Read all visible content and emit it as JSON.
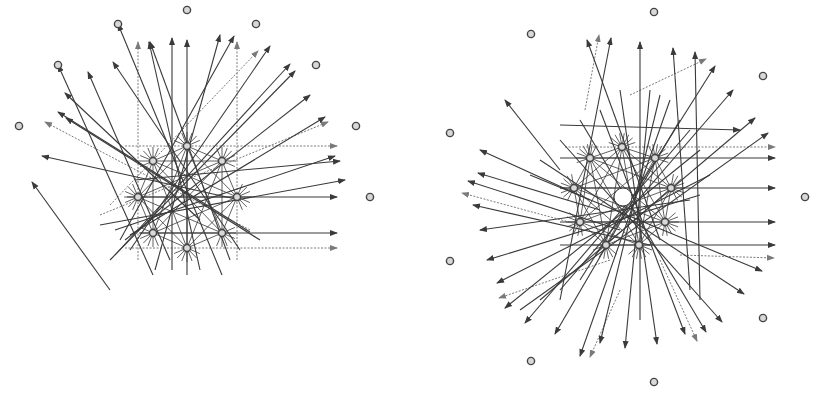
{
  "canvas": {
    "width": 816,
    "height": 395,
    "background": "#ffffff"
  },
  "colors": {
    "line": "#3a3a3a",
    "dashed_line": "#7a7a7a",
    "node_fill": "#d8d8d8",
    "node_stroke": "#444444"
  },
  "diagrams": [
    {
      "name": "left-diagram",
      "center": [
        187,
        197
      ],
      "inner_nodes": [
        [
          187,
          146
        ],
        [
          153,
          161
        ],
        [
          222,
          161
        ],
        [
          138,
          197
        ],
        [
          237,
          197
        ],
        [
          153,
          233
        ],
        [
          222,
          233
        ],
        [
          187,
          248
        ]
      ],
      "outer_nodes": [
        [
          19,
          126
        ],
        [
          58,
          65
        ],
        [
          118,
          24
        ],
        [
          187,
          10
        ],
        [
          256,
          24
        ],
        [
          316,
          65
        ],
        [
          356,
          126
        ],
        [
          370,
          197
        ]
      ],
      "arrows": [
        [
          [
            153,
            275
          ],
          [
            58,
            65
          ]
        ],
        [
          [
            222,
            275
          ],
          [
            118,
            24
          ]
        ],
        [
          [
            187,
            275
          ],
          [
            187,
            40
          ]
        ],
        [
          [
            110,
            290
          ],
          [
            32,
            182
          ]
        ],
        [
          [
            260,
            240
          ],
          [
            66,
            118
          ]
        ],
        [
          [
            250,
            232
          ],
          [
            58,
            112
          ]
        ],
        [
          [
            240,
            200
          ],
          [
            42,
            156
          ]
        ],
        [
          [
            200,
            220
          ],
          [
            65,
            93
          ]
        ],
        [
          [
            170,
            260
          ],
          [
            88,
            72
          ]
        ],
        [
          [
            240,
            250
          ],
          [
            113,
            62
          ]
        ],
        [
          [
            230,
            260
          ],
          [
            150,
            42
          ]
        ],
        [
          [
            200,
            270
          ],
          [
            149,
            42
          ]
        ],
        [
          [
            172,
            270
          ],
          [
            172,
            38
          ]
        ],
        [
          [
            155,
            270
          ],
          [
            220,
            35
          ]
        ],
        [
          [
            120,
            240
          ],
          [
            234,
            36
          ]
        ],
        [
          [
            130,
            250
          ],
          [
            270,
            46
          ]
        ],
        [
          [
            115,
            255
          ],
          [
            290,
            64
          ]
        ],
        [
          [
            110,
            260
          ],
          [
            295,
            71
          ]
        ],
        [
          [
            125,
            240
          ],
          [
            310,
            95
          ]
        ],
        [
          [
            130,
            235
          ],
          [
            325,
            117
          ]
        ],
        [
          [
            115,
            230
          ],
          [
            335,
            156
          ]
        ],
        [
          [
            100,
            225
          ],
          [
            345,
            180
          ]
        ],
        [
          [
            135,
            180
          ],
          [
            340,
            161
          ]
        ],
        [
          [
            127,
            197
          ],
          [
            337,
            197
          ]
        ],
        [
          [
            140,
            233
          ],
          [
            337,
            233
          ]
        ]
      ],
      "dashed_arrows": [
        [
          [
            138,
            260
          ],
          [
            138,
            42
          ]
        ],
        [
          [
            237,
            260
          ],
          [
            237,
            42
          ]
        ],
        [
          [
            125,
            146
          ],
          [
            337,
            146
          ]
        ],
        [
          [
            125,
            248
          ],
          [
            337,
            248
          ]
        ],
        [
          [
            110,
            205
          ],
          [
            258,
            51
          ]
        ],
        [
          [
            250,
            230
          ],
          [
            45,
            122
          ]
        ],
        [
          [
            100,
            215
          ],
          [
            328,
            122
          ]
        ]
      ]
    },
    {
      "name": "right-diagram",
      "center": [
        623,
        197
      ],
      "center_hole_radius": 9,
      "inner_nodes": [
        [
          622,
          147
        ],
        [
          590,
          158
        ],
        [
          655,
          158
        ],
        [
          574,
          188
        ],
        [
          671,
          188
        ],
        [
          580,
          222
        ],
        [
          665,
          222
        ],
        [
          606,
          245
        ],
        [
          639,
          245
        ]
      ],
      "outer_nodes": [
        [
          654,
          12
        ],
        [
          531,
          34
        ],
        [
          763,
          76
        ],
        [
          450,
          133
        ],
        [
          805,
          197
        ],
        [
          450,
          261
        ],
        [
          763,
          318
        ],
        [
          531,
          361
        ],
        [
          654,
          382
        ]
      ],
      "arrows": [
        [
          [
            660,
            240
          ],
          [
            587,
            40
          ]
        ],
        [
          [
            560,
            300
          ],
          [
            611,
            38
          ]
        ],
        [
          [
            640,
            320
          ],
          [
            640,
            42
          ]
        ],
        [
          [
            690,
            290
          ],
          [
            673,
            48
          ]
        ],
        [
          [
            700,
            300
          ],
          [
            695,
            52
          ]
        ],
        [
          [
            580,
            280
          ],
          [
            715,
            66
          ]
        ],
        [
          [
            560,
            290
          ],
          [
            733,
            90
          ]
        ],
        [
          [
            540,
            300
          ],
          [
            755,
            118
          ]
        ],
        [
          [
            520,
            310
          ],
          [
            768,
            133
          ]
        ],
        [
          [
            560,
            170
          ],
          [
            505,
            100
          ]
        ],
        [
          [
            590,
            200
          ],
          [
            480,
            150
          ]
        ],
        [
          [
            600,
            210
          ],
          [
            478,
            173
          ]
        ],
        [
          [
            620,
            230
          ],
          [
            468,
            181
          ]
        ],
        [
          [
            650,
            245
          ],
          [
            473,
            205
          ]
        ],
        [
          [
            690,
            200
          ],
          [
            480,
            230
          ]
        ],
        [
          [
            700,
            195
          ],
          [
            487,
            260
          ]
        ],
        [
          [
            710,
            175
          ],
          [
            497,
            283
          ]
        ],
        [
          [
            700,
            150
          ],
          [
            505,
            308
          ]
        ],
        [
          [
            690,
            130
          ],
          [
            525,
            323
          ]
        ],
        [
          [
            680,
            120
          ],
          [
            555,
            334
          ]
        ],
        [
          [
            670,
            100
          ],
          [
            580,
            356
          ]
        ],
        [
          [
            660,
            95
          ],
          [
            600,
            343
          ]
        ],
        [
          [
            650,
            90
          ],
          [
            625,
            348
          ]
        ],
        [
          [
            620,
            90
          ],
          [
            657,
            344
          ]
        ],
        [
          [
            600,
            110
          ],
          [
            685,
            334
          ]
        ],
        [
          [
            580,
            120
          ],
          [
            706,
            332
          ]
        ],
        [
          [
            560,
            140
          ],
          [
            722,
            322
          ]
        ],
        [
          [
            540,
            160
          ],
          [
            744,
            294
          ]
        ],
        [
          [
            530,
            175
          ],
          [
            762,
            271
          ]
        ],
        [
          [
            560,
            125
          ],
          [
            740,
            130
          ]
        ],
        [
          [
            560,
            158
          ],
          [
            775,
            158
          ]
        ],
        [
          [
            560,
            188
          ],
          [
            775,
            188
          ]
        ],
        [
          [
            560,
            222
          ],
          [
            775,
            222
          ]
        ],
        [
          [
            560,
            245
          ],
          [
            775,
            245
          ]
        ]
      ],
      "dashed_arrows": [
        [
          [
            585,
            110
          ],
          [
            599,
            35
          ]
        ],
        [
          [
            630,
            95
          ],
          [
            706,
            59
          ]
        ],
        [
          [
            565,
            147
          ],
          [
            775,
            147
          ]
        ],
        [
          [
            680,
            255
          ],
          [
            774,
            258
          ]
        ],
        [
          [
            610,
            260
          ],
          [
            499,
            298
          ]
        ],
        [
          [
            580,
            225
          ],
          [
            462,
            193
          ]
        ],
        [
          [
            620,
            290
          ],
          [
            590,
            357
          ]
        ],
        [
          [
            660,
            260
          ],
          [
            697,
            341
          ]
        ]
      ]
    }
  ]
}
